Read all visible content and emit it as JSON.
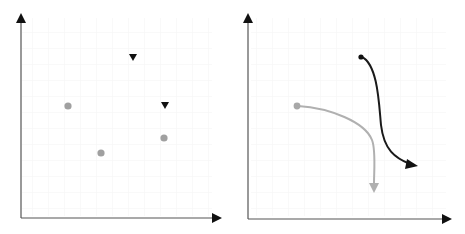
{
  "panels": [
    {
      "name": "scatter-panel",
      "points": [
        {
          "shape": "circle",
          "color": "#a0a0a0"
        },
        {
          "shape": "circle",
          "color": "#a0a0a0"
        },
        {
          "shape": "circle",
          "color": "#a0a0a0"
        },
        {
          "shape": "triangle-down",
          "color": "#111111"
        },
        {
          "shape": "triangle-down",
          "color": "#111111"
        }
      ]
    },
    {
      "name": "trajectory-panel",
      "curves": [
        {
          "color": "#b0b0b0",
          "style": "gray-curve-arrow"
        },
        {
          "color": "#1a1a1a",
          "style": "black-s-curve-arrow"
        }
      ]
    }
  ],
  "colors": {
    "axis": "#333333",
    "grid": "#f2f2f2",
    "gray_point": "#a0a0a0",
    "dark": "#111111"
  }
}
